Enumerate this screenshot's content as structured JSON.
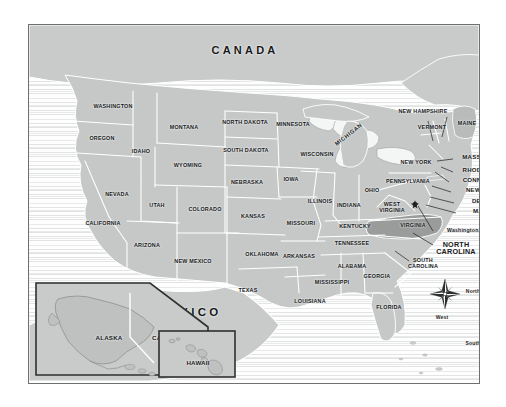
{
  "map": {
    "title_countries": {
      "canada": "CANADA",
      "mexico": "MEXICO"
    },
    "highlight_state": "NORTH CAROLINA",
    "colors": {
      "land": "#c6c8c8",
      "land_highlight": "#9a9c9c",
      "land_neighbor": "#bcbebe",
      "ocean": "#f2f3f3",
      "border_line": "#ffffff",
      "frame": "#6f6f6f",
      "text": "#17191a"
    },
    "states": [
      {
        "name": "WASHINGTON",
        "x": 84,
        "y": 82,
        "cls": "s"
      },
      {
        "name": "OREGON",
        "x": 73,
        "y": 114,
        "cls": "s"
      },
      {
        "name": "IDAHO",
        "x": 112,
        "y": 127,
        "cls": "s"
      },
      {
        "name": "MONTANA",
        "x": 155,
        "y": 103,
        "cls": "s"
      },
      {
        "name": "WYOMING",
        "x": 159,
        "y": 141,
        "cls": "s"
      },
      {
        "name": "NEVADA",
        "x": 88,
        "y": 170,
        "cls": "s"
      },
      {
        "name": "UTAH",
        "x": 128,
        "y": 181,
        "cls": "s"
      },
      {
        "name": "CALIFORNIA",
        "x": 74,
        "y": 199,
        "cls": "s"
      },
      {
        "name": "ARIZONA",
        "x": 118,
        "y": 221,
        "cls": "s"
      },
      {
        "name": "COLORADO",
        "x": 176,
        "y": 185,
        "cls": "s"
      },
      {
        "name": "NEW MEXICO",
        "x": 164,
        "y": 237,
        "cls": "s"
      },
      {
        "name": "NORTH DAKOTA",
        "x": 216,
        "y": 98,
        "cls": "s"
      },
      {
        "name": "SOUTH DAKOTA",
        "x": 217,
        "y": 126,
        "cls": "s"
      },
      {
        "name": "NEBRASKA",
        "x": 218,
        "y": 158,
        "cls": "s"
      },
      {
        "name": "KANSAS",
        "x": 224,
        "y": 192,
        "cls": "s"
      },
      {
        "name": "OKLAHOMA",
        "x": 233,
        "y": 230,
        "cls": "s"
      },
      {
        "name": "TEXAS",
        "x": 219,
        "y": 266,
        "cls": "s"
      },
      {
        "name": "MINNESOTA",
        "x": 264,
        "y": 100,
        "cls": "s"
      },
      {
        "name": "WISCONSIN",
        "x": 288,
        "y": 130,
        "cls": "s"
      },
      {
        "name": "IOWA",
        "x": 262,
        "y": 155,
        "cls": "s"
      },
      {
        "name": "MISSOURI",
        "x": 272,
        "y": 199,
        "cls": "s"
      },
      {
        "name": "ARKANSAS",
        "x": 270,
        "y": 232,
        "cls": "s"
      },
      {
        "name": "LOUISIANA",
        "x": 281,
        "y": 277,
        "cls": "s"
      },
      {
        "name": "MISSISSIPPI",
        "x": 303,
        "y": 258,
        "cls": "s"
      },
      {
        "name": "ALABAMA",
        "x": 323,
        "y": 242,
        "cls": "s"
      },
      {
        "name": "TENNESSEE",
        "x": 323,
        "y": 219,
        "cls": "s"
      },
      {
        "name": "KENTUCKY",
        "x": 326,
        "y": 202,
        "cls": "s"
      },
      {
        "name": "ILLINOIS",
        "x": 291,
        "y": 177,
        "cls": "s"
      },
      {
        "name": "INDIANA",
        "x": 320,
        "y": 181,
        "cls": "s"
      },
      {
        "name": "OHIO",
        "x": 343,
        "y": 166,
        "cls": "s"
      },
      {
        "name": "GEORGIA",
        "x": 348,
        "y": 252,
        "cls": "s"
      },
      {
        "name": "FLORIDA",
        "x": 360,
        "y": 283,
        "cls": "s"
      },
      {
        "name": "NEW YORK",
        "x": 387,
        "y": 138,
        "cls": "s"
      },
      {
        "name": "PENNSYLVANIA",
        "x": 379,
        "y": 157,
        "cls": "s"
      },
      {
        "name": "VIRGINIA",
        "x": 384,
        "y": 201,
        "cls": "s"
      },
      {
        "name": "MAINE",
        "x": 438,
        "y": 99,
        "cls": "s"
      },
      {
        "name": "VERMONT",
        "x": 403,
        "y": 103,
        "cls": "s"
      },
      {
        "name": "NEW HAMPSHIRE",
        "x": 394,
        "y": 87,
        "cls": "s"
      }
    ],
    "state_multiline": [
      {
        "line1": "WEST",
        "line2": "VIRGINIA",
        "x": 363,
        "y": 182,
        "cls": "s"
      },
      {
        "line1": "NORTH",
        "line2": "CAROLINA",
        "x": 427,
        "y": 223,
        "cls": "nc"
      },
      {
        "line1": "SOUTH",
        "line2": "CAROLINA",
        "x": 394,
        "y": 238,
        "cls": "s"
      }
    ],
    "michigan": {
      "name": "MICHIGAN",
      "x": 320,
      "y": 110
    },
    "callouts": [
      {
        "name": "MASSACHUSETTS",
        "x": 462,
        "y": 132,
        "lx1": 424,
        "ly1": 134,
        "lx2": 411,
        "ly2": 136
      },
      {
        "name": "RHODE ISLAND",
        "x": 458,
        "y": 145,
        "lx1": 424,
        "ly1": 147,
        "lx2": 413,
        "ly2": 142
      },
      {
        "name": "CONNECTICUT",
        "x": 457,
        "y": 155,
        "lx1": 420,
        "ly1": 157,
        "lx2": 408,
        "ly2": 146
      },
      {
        "name": "NEW JERSEY",
        "x": 458,
        "y": 165,
        "lx1": 422,
        "ly1": 167,
        "lx2": 404,
        "ly2": 160
      },
      {
        "name": "DELAWARE",
        "x": 461,
        "y": 176,
        "lx1": 425,
        "ly1": 178,
        "lx2": 402,
        "ly2": 172
      },
      {
        "name": "MARYLAND",
        "x": 462,
        "y": 186,
        "lx1": 427,
        "ly1": 188,
        "lx2": 398,
        "ly2": 180
      }
    ],
    "washington_dc": {
      "label": "Washington, D.C.",
      "x": 441,
      "y": 206,
      "marker_x": 386,
      "marker_y": 179
    },
    "compass": {
      "cx": 444,
      "cy": 293,
      "north": "North",
      "south": "South",
      "east": "East",
      "west": "West"
    },
    "insets": [
      {
        "id": "alaska",
        "label": "ALASKA",
        "lx": 80,
        "ly": 313
      },
      {
        "id": "canada_inset",
        "label": "CANADA",
        "lx": 137,
        "ly": 313
      },
      {
        "id": "hawaii",
        "label": "HAWAII",
        "lx": 191,
        "ly": 363
      }
    ]
  }
}
